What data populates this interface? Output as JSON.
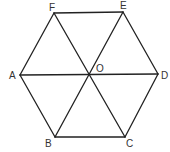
{
  "diagram": {
    "stroke_color": "#222222",
    "label_color": "#333333",
    "vertices": {
      "A": {
        "x": 20,
        "y": 75
      },
      "B": {
        "x": 55,
        "y": 137
      },
      "C": {
        "x": 125,
        "y": 137
      },
      "D": {
        "x": 158,
        "y": 74
      },
      "E": {
        "x": 123,
        "y": 12
      },
      "F": {
        "x": 54,
        "y": 13
      },
      "O": {
        "x": 89,
        "y": 76
      }
    },
    "labels": {
      "A": "A",
      "B": "B",
      "C": "C",
      "D": "D",
      "E": "E",
      "F": "F",
      "O": "O"
    },
    "edges": [
      [
        "A",
        "B"
      ],
      [
        "B",
        "C"
      ],
      [
        "C",
        "D"
      ],
      [
        "D",
        "E"
      ],
      [
        "E",
        "F"
      ],
      [
        "F",
        "A"
      ],
      [
        "A",
        "D"
      ],
      [
        "B",
        "E"
      ],
      [
        "C",
        "F"
      ]
    ]
  }
}
